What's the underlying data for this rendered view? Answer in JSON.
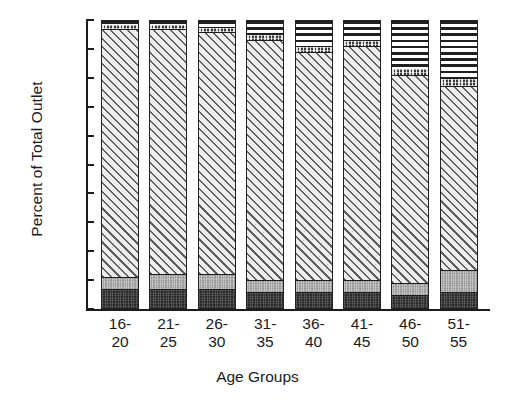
{
  "chart_data": {
    "type": "bar",
    "subtype": "stacked-bar-100-percent",
    "title": "",
    "xlabel": "Age Groups",
    "ylabel": "Percent of Total Outlet",
    "ylim": [
      0,
      100
    ],
    "yticks": [
      0,
      10,
      20,
      30,
      40,
      50,
      60,
      70,
      80,
      90,
      100
    ],
    "ytick_labels": [
      "0",
      "10",
      "20",
      "30",
      "40",
      "50",
      "60",
      "70",
      "80",
      "90",
      "100"
    ],
    "grid": false,
    "legend": "none",
    "categories": [
      "16-\n20",
      "21-\n25",
      "26-\n30",
      "31-\n35",
      "36-\n40",
      "41-\n45",
      "46-\n50",
      "51-\n55"
    ],
    "category_lines": [
      [
        "16-",
        "20"
      ],
      [
        "21-",
        "25"
      ],
      [
        "26-",
        "30"
      ],
      [
        "31-",
        "35"
      ],
      [
        "36-",
        "40"
      ],
      [
        "41-",
        "45"
      ],
      [
        "46-",
        "50"
      ],
      [
        "51-",
        "55"
      ]
    ],
    "series": [
      {
        "name": "segment-1-bottom",
        "pattern": "dark-solid",
        "color": "#2b2b2b",
        "values": [
          7,
          7,
          7,
          6,
          6,
          6,
          5,
          6
        ]
      },
      {
        "name": "segment-2",
        "pattern": "medium-gray",
        "color": "#a8a8a8",
        "values": [
          4,
          5,
          5,
          4,
          4,
          4,
          4,
          7.5
        ]
      },
      {
        "name": "segment-3",
        "pattern": "diagonal-hatch",
        "color": "#e9e9e9",
        "values": [
          86,
          85,
          84,
          83,
          79,
          81,
          72,
          63.5
        ]
      },
      {
        "name": "segment-4",
        "pattern": "dark-checkered",
        "color": "#3a3a3a",
        "values": [
          1.5,
          1.5,
          1.5,
          2,
          2,
          2,
          2.5,
          3
        ]
      },
      {
        "name": "segment-5-top",
        "pattern": "horizontal-stripes",
        "color": "#1f1f1f",
        "values": [
          1.5,
          1.5,
          2.5,
          5,
          9,
          7,
          16.5,
          20
        ]
      }
    ]
  },
  "axes": {
    "y_title": "Percent of Total Outlet",
    "x_title": "Age Groups"
  }
}
